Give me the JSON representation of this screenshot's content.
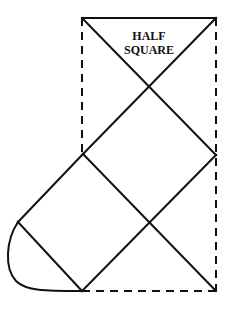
{
  "diagram": {
    "label_line1": "HALF",
    "label_line2": "SQUARE",
    "stroke_color": "#111111",
    "background": "#ffffff",
    "points": {
      "top_left": [
        82,
        18
      ],
      "top_right": [
        216,
        18
      ],
      "upper_cross": [
        149,
        87
      ],
      "left_vertex": [
        83,
        154
      ],
      "right_vertex": [
        216,
        155
      ],
      "lower_cross": [
        149,
        222
      ],
      "far_left": [
        18,
        222
      ],
      "bottom_left": [
        82,
        291
      ],
      "bottom_right": [
        216,
        291
      ]
    }
  }
}
